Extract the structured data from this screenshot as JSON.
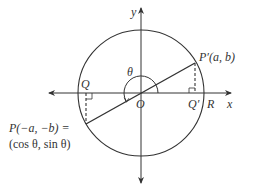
{
  "figure": {
    "labels": {
      "y_axis": "y",
      "x_axis": "x",
      "theta": "θ",
      "origin": "O",
      "Q": "Q",
      "Q_prime": "Q′",
      "R": "R",
      "P_prime_name": "P′",
      "P_prime_coords": "(a, b)",
      "P_name": "P",
      "P_coords": "(−a, −b) =",
      "P_trig": "(cos θ, sin θ)"
    },
    "colors": {
      "stroke": "#333333",
      "background": "#ffffff"
    },
    "geometry": {
      "origin": [
        141,
        93
      ],
      "radius": 63,
      "P_prime": [
        195,
        63
      ],
      "P": [
        86,
        124
      ]
    }
  }
}
